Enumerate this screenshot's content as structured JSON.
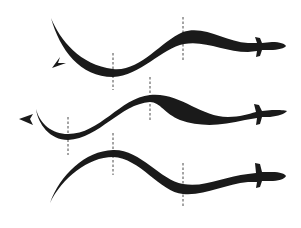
{
  "figure": {
    "description": "Three successive stages of anguilliform (eel-like) swimming; dashed lines mark wave crest/trough positions",
    "ink_color": "#1a1a1a",
    "dash_color": "#4a4a4a",
    "background": "#ffffff"
  },
  "stages": [
    {
      "label": "stage-1",
      "dashed_lines": [
        {
          "x": 113,
          "y1": 53,
          "y2": 90
        },
        {
          "x": 183,
          "y1": 17,
          "y2": 62
        }
      ],
      "arrow": {
        "x": 55,
        "y": 65,
        "direction": "down-left"
      }
    },
    {
      "label": "stage-2",
      "dashed_lines": [
        {
          "x": 68,
          "y1": 117,
          "y2": 155
        },
        {
          "x": 150,
          "y1": 77,
          "y2": 122
        }
      ],
      "arrow": {
        "x": 25,
        "y": 119,
        "direction": "left"
      }
    },
    {
      "label": "stage-3",
      "dashed_lines": [
        {
          "x": 113,
          "y1": 133,
          "y2": 175
        },
        {
          "x": 183,
          "y1": 163,
          "y2": 207
        }
      ],
      "arrow": null
    }
  ]
}
